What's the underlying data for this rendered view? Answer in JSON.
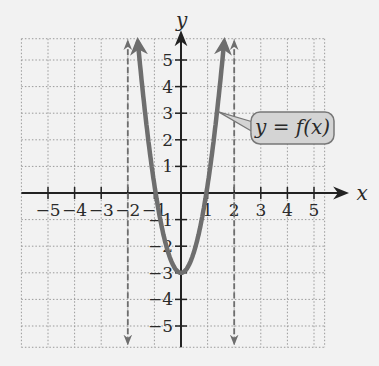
{
  "chart_data": {
    "type": "line",
    "title": "",
    "xlabel": "x",
    "ylabel": "y",
    "xlim": [
      -6,
      6
    ],
    "ylim": [
      -6,
      6
    ],
    "grid": true,
    "x_ticks": [
      -5,
      -4,
      -3,
      -2,
      -1,
      1,
      2,
      3,
      4,
      5
    ],
    "y_ticks": [
      -5,
      -4,
      -3,
      -2,
      -1,
      1,
      2,
      3,
      4,
      5
    ],
    "x_tick_labels": [
      "−5",
      "−4",
      "−3",
      "−2",
      "−1",
      "1",
      "2",
      "3",
      "4",
      "5"
    ],
    "y_tick_labels": [
      "−5",
      "−4",
      "−3",
      "−2",
      "−1",
      "1",
      "2",
      "3",
      "4",
      "5"
    ],
    "series": [
      {
        "name": "y = f(x)",
        "style": "solid",
        "color": "#6e6e6e",
        "description": "Upward-opening parabola, vertex (0,-3), x-intercepts -1 and 1, arrows at both ends beyond y=5.5",
        "x": [
          -1.6,
          -1.5,
          -1.25,
          -1,
          -0.75,
          -0.5,
          -0.25,
          0,
          0.25,
          0.5,
          0.75,
          1,
          1.25,
          1.5,
          1.6
        ],
        "y": [
          5.7,
          5.0,
          3.6,
          0,
          -1.3,
          -2.25,
          -2.8,
          -3,
          -2.8,
          -2.25,
          -1.3,
          0,
          1.7,
          3.75,
          4.7
        ]
      },
      {
        "name": "x = -2",
        "style": "dashed",
        "color": "#6e6e6e",
        "description": "Vertical dashed line with arrows at both ends"
      },
      {
        "name": "x = 2",
        "style": "dashed",
        "color": "#6e6e6e",
        "description": "Vertical dashed line with arrows at both ends"
      }
    ],
    "annotations": [
      {
        "text": "y = f(x)",
        "type": "callout",
        "points_to": [
          1.3,
          3
        ]
      }
    ]
  },
  "labels": {
    "x_axis": "x",
    "y_axis": "y",
    "callout": "y = f(x)"
  },
  "colors": {
    "background": "#f2f2f2",
    "grid": "#9a9a9a",
    "axis": "#222222",
    "curve": "#6e6e6e",
    "callout_fill": "#d4d4d4",
    "callout_stroke": "#777777"
  }
}
